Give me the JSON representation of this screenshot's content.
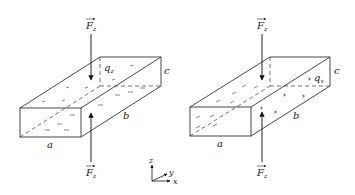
{
  "figure": {
    "left_panel": {
      "force_top_label": "F",
      "force_top_sub": "z",
      "force_bottom_label": "F",
      "force_bottom_sub": "z",
      "charge_label": "q",
      "charge_sub": "z",
      "dim_a": "a",
      "dim_b": "b",
      "dim_c": "c",
      "charge_sign": "-"
    },
    "right_panel": {
      "force_top_label": "F",
      "force_top_sub": "z",
      "force_bottom_label": "F",
      "force_bottom_sub": "z",
      "charge_label": "q",
      "charge_sub": "x",
      "dim_a": "a",
      "dim_b": "b",
      "dim_c": "c",
      "charge_sign_top": "-",
      "charge_sign_side": "+"
    },
    "axes": {
      "z": "z",
      "y": "y",
      "x": "x"
    }
  }
}
